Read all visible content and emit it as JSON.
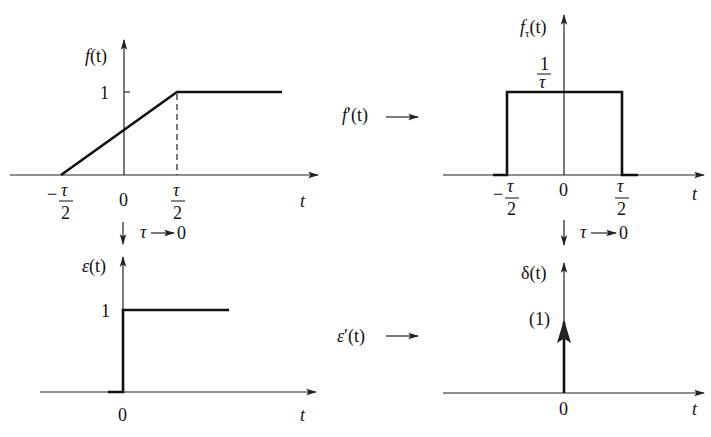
{
  "panels": {
    "top_left": {
      "y_label_fn": "f",
      "y_label_arg": "(t)",
      "level_label": "1",
      "x_label": "t",
      "ticks": {
        "neg_num": "τ",
        "neg_den": "2",
        "neg_sign": "−",
        "zero": "0",
        "pos_num": "τ",
        "pos_den": "2"
      }
    },
    "top_right": {
      "y_label_fn": "f",
      "y_label_sub": "τ",
      "y_label_arg": "(t)",
      "level_num": "1",
      "level_den": "τ",
      "x_label": "t",
      "side_label_fn": "f",
      "side_label_prime": "′",
      "side_label_arg": "(t)",
      "ticks": {
        "neg_num": "τ",
        "neg_den": "2",
        "neg_sign": "−",
        "zero": "0",
        "pos_num": "τ",
        "pos_den": "2"
      }
    },
    "bottom_left": {
      "y_label_fn": "ε",
      "y_label_arg": "(t)",
      "level_label": "1",
      "x_label": "t",
      "zero": "0"
    },
    "bottom_right": {
      "y_label_fn": "δ",
      "y_label_arg": "(t)",
      "impulse_weight": "(1)",
      "x_label": "t",
      "zero": "0",
      "side_label_fn": "ε",
      "side_label_prime": "′",
      "side_label_arg": "(t)"
    }
  },
  "limits": {
    "left": {
      "tau": "τ",
      "arrow": "→",
      "zero": "0"
    },
    "right": {
      "tau": "τ",
      "arrow": "→",
      "zero": "0"
    }
  }
}
